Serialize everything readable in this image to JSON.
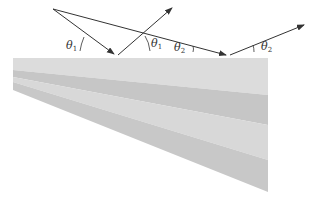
{
  "diagram": {
    "title": "",
    "colors": {
      "background": "#ffffff",
      "band_light": "#dcdcdc",
      "band_dark": "#c4c4c4",
      "ray": "#333333"
    },
    "labels": {
      "theta1_incident": {
        "symbol": "θ",
        "subscript": "1"
      },
      "theta1_reflected": {
        "symbol": "θ",
        "subscript": "1"
      },
      "theta2_incident": {
        "symbol": "θ",
        "subscript": "2"
      },
      "theta2_reflected": {
        "symbol": "θ",
        "subscript": "2"
      }
    },
    "rays": [
      {
        "name": "ray-1-incident",
        "from": [
          53,
          9
        ],
        "to": [
          116,
          55
        ]
      },
      {
        "name": "ray-1-reflected",
        "from": [
          116,
          55
        ],
        "to": [
          174,
          6
        ]
      },
      {
        "name": "ray-2-incident",
        "from": [
          53,
          9
        ],
        "to": [
          228,
          55
        ]
      },
      {
        "name": "ray-2-reflected",
        "from": [
          228,
          55
        ],
        "to": [
          306,
          24
        ]
      }
    ]
  }
}
